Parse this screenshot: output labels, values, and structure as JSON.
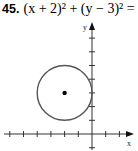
{
  "problem": {
    "number": "45.",
    "equation": "(x + 2)² + (y − 3)² = 4"
  },
  "chart_data": {
    "type": "scatter",
    "xlabel": "x",
    "ylabel": "y",
    "xlim": [
      -6,
      2
    ],
    "ylim": [
      -1,
      7
    ],
    "grid": false,
    "tick_spacing": 1,
    "tick_labels": false,
    "shapes": [
      {
        "kind": "circle",
        "center": [
          -2,
          3
        ],
        "radius": 2
      }
    ],
    "points": [
      {
        "x": -2,
        "y": 3,
        "label": "center"
      }
    ]
  },
  "axes": {
    "x_label": "x",
    "y_label": "y"
  }
}
